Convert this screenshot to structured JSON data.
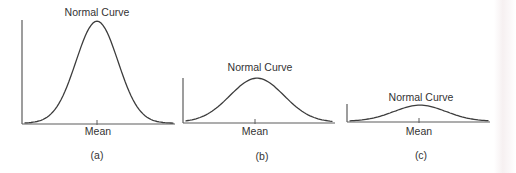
{
  "page": {
    "background": "#ffffff",
    "edge_tint_color": "#efe4e6"
  },
  "styles": {
    "curve_color": "#3c3c3c",
    "axis_color": "#5c5c5c",
    "text_color": "#333333"
  },
  "chart_data": {
    "type": "line",
    "title": "",
    "panels": [
      {
        "caption": "(a)",
        "curve_label": "Normal Curve",
        "x_axis_label": "Mean",
        "curve": {
          "shape": "gaussian",
          "peak_height_px": 102,
          "sigma_px": 21,
          "mean_x_px": 97
        },
        "geometry": {
          "origin_x": 22,
          "baseline_y": 124,
          "axis_right_x": 175,
          "yaxis_top_y": 20,
          "tick_x": 97
        }
      },
      {
        "caption": "(b)",
        "curve_label": "Normal Curve",
        "x_axis_label": "Mean",
        "curve": {
          "shape": "gaussian",
          "peak_height_px": 44,
          "sigma_px": 27,
          "mean_x_px": 257
        },
        "geometry": {
          "origin_x": 183,
          "baseline_y": 123,
          "axis_right_x": 335,
          "yaxis_top_y": 78,
          "tick_x": 255
        }
      },
      {
        "caption": "(c)",
        "curve_label": "Normal Curve",
        "x_axis_label": "Mean",
        "curve": {
          "shape": "gaussian",
          "peak_height_px": 16,
          "sigma_px": 26,
          "mean_x_px": 420
        },
        "geometry": {
          "origin_x": 347,
          "baseline_y": 122,
          "axis_right_x": 490,
          "yaxis_top_y": 104,
          "tick_x": 419
        }
      }
    ]
  }
}
